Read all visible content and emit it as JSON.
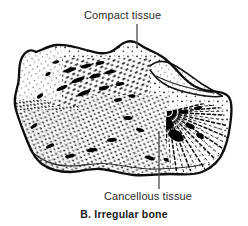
{
  "figure": {
    "caption": "B. Irregular bone",
    "background_color": "#ffffff",
    "ink_color": "#1a1a1a",
    "text_color": "#2b2b2b"
  },
  "labels": {
    "compact": {
      "text": "Compact tissue",
      "leader_line": "vertical leader from text down to superior bone cortex"
    },
    "cancellous": {
      "text": "Cancellous tissue",
      "leader_line": "vertical leader from text up into trabecular interior"
    }
  },
  "illustration": {
    "subject": "irregular bone cross-section",
    "features": [
      "thick dark cortical outline",
      "stippled cancellous trabecular interior",
      "radiating trabeculae fan at right",
      "articular facet process at upper right"
    ]
  }
}
